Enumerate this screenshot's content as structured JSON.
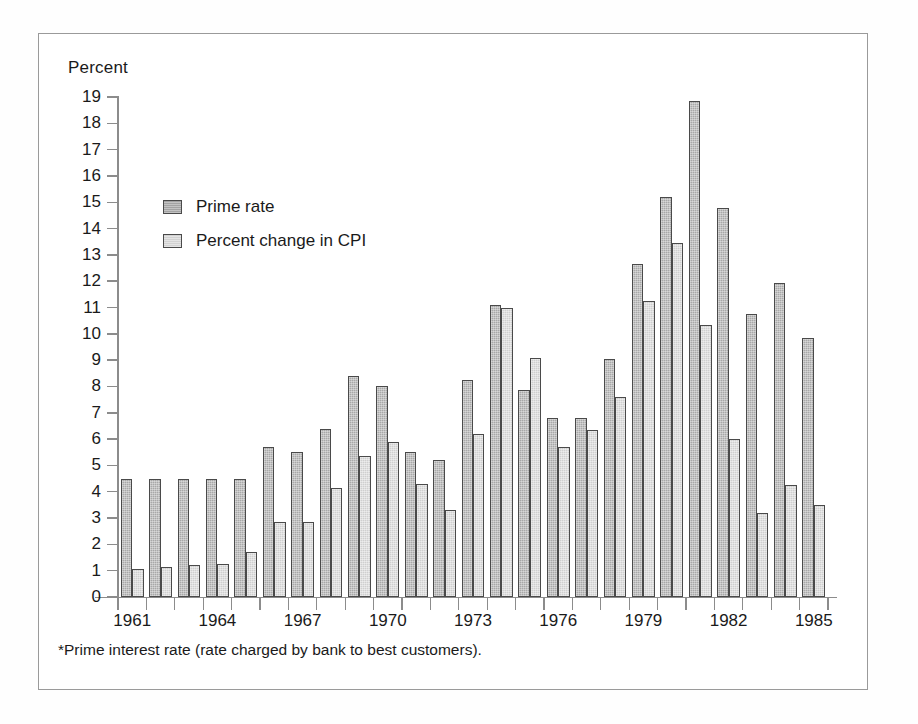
{
  "figure": {
    "axis_title": "Percent",
    "footnote": "*Prime interest rate (rate charged by bank to best customers).",
    "frame_color": "#9a9a9a",
    "background": "#ffffff"
  },
  "legend": {
    "position": "upper-left-inside",
    "entries": [
      {
        "label": "Prime rate",
        "color": "#a3a3a3",
        "key": "prime"
      },
      {
        "label": "Percent change in CPI",
        "color": "#d2d2d2",
        "key": "cpi"
      }
    ]
  },
  "chart_data": {
    "type": "bar",
    "title": "",
    "subtitle": "",
    "xlabel": "",
    "ylabel": "Percent",
    "ylim": [
      0,
      19
    ],
    "ytick_step": 1,
    "grid": false,
    "legend_position": "upper-left-inside",
    "annotations": [
      "*Prime interest rate (rate charged by bank to best customers)."
    ],
    "categories": [
      "1961",
      "1962",
      "1963",
      "1964",
      "1965",
      "1966",
      "1967",
      "1968",
      "1969",
      "1970",
      "1971",
      "1972",
      "1973",
      "1974",
      "1975",
      "1976",
      "1977",
      "1978",
      "1979",
      "1980",
      "1981",
      "1982",
      "1983",
      "1984",
      "1985"
    ],
    "xtick_labels": [
      "1961",
      "1964",
      "1967",
      "1970",
      "1973",
      "1976",
      "1979",
      "1982",
      "1985"
    ],
    "ytick_labels": [
      "0",
      "1",
      "2",
      "3",
      "4",
      "5",
      "6",
      "7",
      "8",
      "9",
      "10",
      "11",
      "12",
      "13",
      "14",
      "15",
      "16",
      "17",
      "18",
      "19"
    ],
    "series": [
      {
        "name": "Prime rate",
        "color": "#a8a8a8",
        "values": [
          4.5,
          4.5,
          4.5,
          4.5,
          4.5,
          5.7,
          5.5,
          6.4,
          8.4,
          8.0,
          5.5,
          5.2,
          8.25,
          11.1,
          7.85,
          6.8,
          6.8,
          9.05,
          12.65,
          15.2,
          18.85,
          14.8,
          10.75,
          11.95,
          9.85
        ]
      },
      {
        "name": "Percent change in CPI",
        "color": "#cfcfcf",
        "values": [
          1.05,
          1.15,
          1.2,
          1.25,
          1.7,
          2.85,
          2.85,
          4.15,
          5.35,
          5.9,
          4.3,
          3.3,
          6.2,
          11.0,
          9.1,
          5.7,
          6.35,
          7.6,
          11.25,
          13.45,
          10.35,
          6.0,
          3.2,
          4.25,
          3.5
        ]
      }
    ]
  }
}
